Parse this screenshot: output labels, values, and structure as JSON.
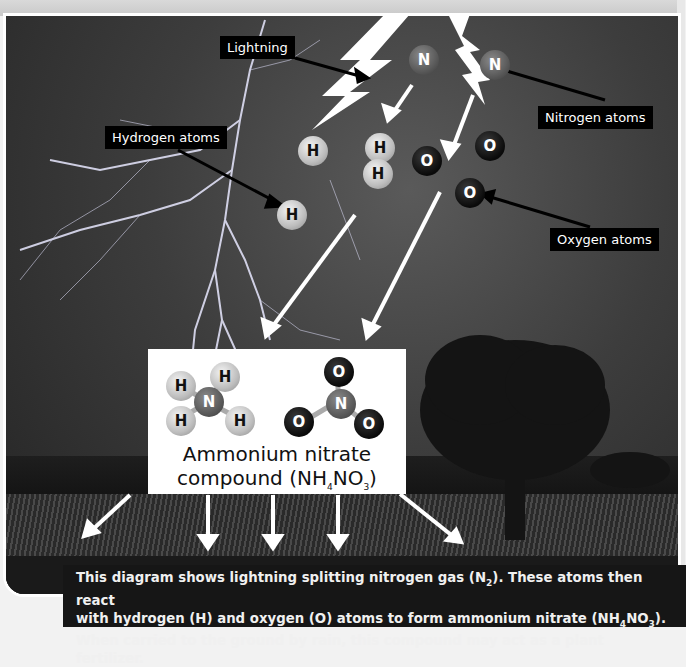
{
  "labels": {
    "lightning": "Lightning",
    "hydrogen": "Hydrogen atoms",
    "nitrogen": "Nitrogen atoms",
    "oxygen": "Oxygen atoms"
  },
  "atoms": {
    "hydrogen_symbol": "H",
    "nitrogen_symbol": "N",
    "oxygen_symbol": "O"
  },
  "compound": {
    "title_line1": "Ammonium nitrate",
    "title_line2_prefix": "compound (NH",
    "sub1": "4",
    "mid": "NO",
    "sub2": "3",
    "suffix": ")"
  },
  "caption": {
    "l1a": "This diagram shows lightning splitting nitrogen gas (N",
    "l1sub": "2",
    "l1b": "). These atoms then react",
    "l2a": "with hydrogen (H) and oxygen (O) atoms to form ammonium nitrate (NH",
    "l2sub1": "4",
    "l2mid": "NO",
    "l2sub2": "3",
    "l2b": ").",
    "l3": "When carried to the ground by rain, this compound may act as a plant fertilizer."
  },
  "colors": {
    "label_bg": "#000000",
    "label_text": "#ffffff",
    "caption_bg": "#161616"
  }
}
